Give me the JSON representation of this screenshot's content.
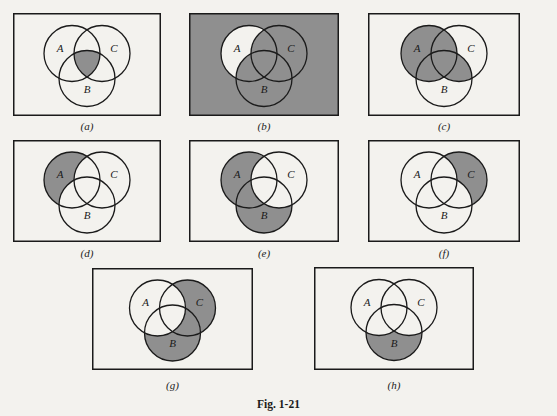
{
  "figure": {
    "caption": "Fig. 1-21",
    "shade_color": "#8f8f8f",
    "background_color": "#f3f2ee",
    "line_color": "#1a1a1a",
    "set_labels": [
      "A",
      "B",
      "C"
    ]
  },
  "panels": [
    {
      "id": "a",
      "label": "(a)",
      "shaded_region": "A ∩ B ∩ C",
      "regions": [
        "ABC"
      ]
    },
    {
      "id": "b",
      "label": "(b)",
      "shaded_region": "complement of (A only)",
      "regions": [
        "U",
        "AB",
        "AC",
        "ABC",
        "B",
        "C",
        "BC"
      ]
    },
    {
      "id": "c",
      "label": "(c)",
      "shaded_region": "A ∪ (B ∩ C)",
      "regions": [
        "A",
        "AB",
        "AC",
        "ABC",
        "BC"
      ]
    },
    {
      "id": "d",
      "label": "(d)",
      "shaded_region": "A only",
      "regions": [
        "A"
      ]
    },
    {
      "id": "e",
      "label": "(e)",
      "shaded_region": "(A ∪ B) − C",
      "regions": [
        "A",
        "AB",
        "B"
      ]
    },
    {
      "id": "f",
      "label": "(f)",
      "shaded_region": "C only",
      "regions": [
        "C"
      ]
    },
    {
      "id": "g",
      "label": "(g)",
      "shaded_region": "(B ∪ C) − A",
      "regions": [
        "B",
        "C",
        "BC"
      ]
    },
    {
      "id": "h",
      "label": "(h)",
      "shaded_region": "B only",
      "regions": [
        "B"
      ]
    }
  ]
}
